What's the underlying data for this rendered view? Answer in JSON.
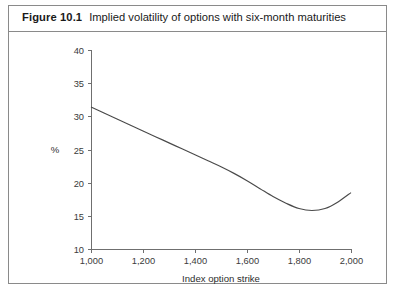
{
  "figure": {
    "label": "Figure 10.1",
    "title": "Implied volatility of options with six-month maturities"
  },
  "chart_data": {
    "type": "line",
    "title": "Implied volatility of options with six-month maturities",
    "xlabel": "Index option strike",
    "ylabel": "%",
    "xlim": [
      1000,
      2000
    ],
    "ylim": [
      10,
      40
    ],
    "xticks": [
      1000,
      1200,
      1400,
      1600,
      1800,
      2000
    ],
    "xtick_labels": [
      "1,000",
      "1,200",
      "1,400",
      "1,600",
      "1,800",
      "2,000"
    ],
    "yticks": [
      10,
      15,
      20,
      25,
      30,
      35,
      40
    ],
    "ytick_labels": [
      "10",
      "15",
      "20",
      "25",
      "30",
      "35",
      "40"
    ],
    "grid": false,
    "legend": null,
    "series": [
      {
        "name": "Implied volatility",
        "x": [
          1000,
          1050,
          1100,
          1150,
          1200,
          1250,
          1300,
          1350,
          1400,
          1450,
          1500,
          1550,
          1600,
          1650,
          1700,
          1750,
          1800,
          1850,
          1900,
          1950,
          2000
        ],
        "y": [
          31.4,
          30.5,
          29.6,
          28.7,
          27.8,
          26.9,
          26.0,
          25.1,
          24.2,
          23.3,
          22.4,
          21.4,
          20.3,
          19.1,
          17.9,
          16.9,
          16.1,
          15.8,
          16.1,
          17.1,
          18.5
        ]
      }
    ]
  },
  "axis": {
    "y_unit_label": "%",
    "x_title": "Index option strike"
  }
}
